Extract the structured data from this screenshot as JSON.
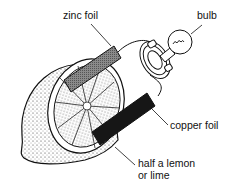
{
  "diagram": {
    "labels": {
      "zinc": "zinc foil",
      "bulb": "bulb",
      "copper": "copper foil",
      "lemon_line1": "half a lemon",
      "lemon_line2": "or lime"
    },
    "colors": {
      "ink": "#111111",
      "zinc_fill": "#7a7a7a",
      "copper_fill": "#161616",
      "background": "#ffffff"
    }
  }
}
